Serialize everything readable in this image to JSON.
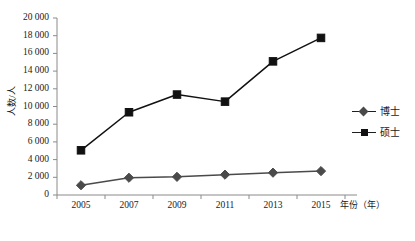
{
  "chart_data": {
    "type": "line",
    "title": "",
    "xlabel": "年份（年）",
    "ylabel": "人数/人",
    "categories": [
      "2005",
      "2007",
      "2009",
      "2011",
      "2013",
      "2015"
    ],
    "ylim": [
      0,
      20000
    ],
    "ytick_step": 2000,
    "ytick_labels": [
      "0",
      "2 000",
      "4 000",
      "6 000",
      "8 000",
      "10 000",
      "12 000",
      "14 000",
      "16 000",
      "18 000",
      "20 000"
    ],
    "ytick_values": [
      0,
      2000,
      4000,
      6000,
      8000,
      10000,
      12000,
      14000,
      16000,
      18000,
      20000
    ],
    "grid": false,
    "legend_position": "right",
    "series": [
      {
        "name": "博士",
        "marker": "diamond",
        "color": "#4a4a4a",
        "values": [
          1100,
          1950,
          2050,
          2300,
          2520,
          2700
        ]
      },
      {
        "name": "硕士",
        "marker": "square",
        "color": "#111111",
        "values": [
          5050,
          9350,
          11350,
          10550,
          15100,
          17750
        ]
      }
    ]
  },
  "legend": {
    "items": [
      {
        "label": "博士"
      },
      {
        "label": "硕士"
      }
    ]
  }
}
